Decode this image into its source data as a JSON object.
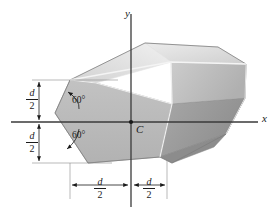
{
  "figure": {
    "type": "engineering-diagram",
    "background_color": "#ffffff"
  },
  "axes": {
    "x_label": "x",
    "y_label": "y",
    "axis_color": "#3a3a3a",
    "origin_label": "C"
  },
  "annotations": {
    "angle_upper": "60°",
    "angle_lower": "60°",
    "angle_value": 60,
    "angle_unit": "degrees"
  },
  "dimensions": {
    "vertical_upper": {
      "numerator": "d",
      "denominator": "2"
    },
    "vertical_lower": {
      "numerator": "d",
      "denominator": "2"
    },
    "horizontal_left": {
      "numerator": "d",
      "denominator": "2"
    },
    "horizontal_right": {
      "numerator": "d",
      "denominator": "2"
    }
  },
  "solid": {
    "face_front_color": "#b9b9b9",
    "face_top_left_color": "#e8e8e8",
    "face_top_right_color": "#dcdcdc",
    "face_right_upper_color": "#c8c8c8",
    "face_right_lower_color": "#a0a0a0",
    "face_bottom_right_color": "#8f8f8f",
    "edge_color": "#f2f2f2",
    "outline_color": "#7a7a7a"
  }
}
